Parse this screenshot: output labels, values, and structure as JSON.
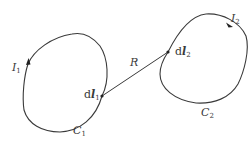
{
  "diagram": {
    "stroke_color": "#3a3a3a",
    "loop1": {
      "curve_label": "C",
      "curve_sub": "1",
      "current_label": "I",
      "current_sub": "1",
      "element_label_prefix": "d",
      "element_label_var": "l",
      "element_sub": "1"
    },
    "loop2": {
      "curve_label": "C",
      "curve_sub": "2",
      "current_label": "I",
      "current_sub": "2",
      "element_label_prefix": "d",
      "element_label_var": "l",
      "element_sub": "2"
    },
    "separation": {
      "label": "R"
    }
  }
}
